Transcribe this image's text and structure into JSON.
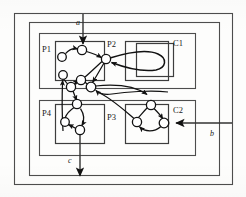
{
  "diagram": {
    "kind": "petri-net",
    "background_color": "#fdfdfc",
    "stroke_color": "#111111",
    "box_stroke_color": "#4d4d4d"
  },
  "containers": [
    {
      "id": "outer",
      "label": "",
      "x": 14,
      "y": 13,
      "w": 219,
      "h": 172
    },
    {
      "id": "system",
      "label": "",
      "x": 29,
      "y": 22,
      "w": 191,
      "h": 154
    },
    {
      "id": "C1",
      "label": "C1",
      "x": 39,
      "y": 33,
      "w": 157,
      "h": 56,
      "label_x": 173,
      "label_y": 46
    },
    {
      "id": "C2",
      "label": "C2",
      "x": 39,
      "y": 100,
      "w": 157,
      "h": 56,
      "label_x": 173,
      "label_y": 113
    }
  ],
  "processes": [
    {
      "id": "P1",
      "label": "P1",
      "x": 55,
      "y": 41,
      "w": 50,
      "h": 40,
      "label_x": 43,
      "label_y": 51
    },
    {
      "id": "P2",
      "label": "P2",
      "x": 125,
      "y": 41,
      "w": 44,
      "h": 40,
      "label_x": 108,
      "label_y": 47
    },
    {
      "id": "P4",
      "label": "P4",
      "x": 55,
      "y": 104,
      "w": 50,
      "h": 40,
      "label_x": 43,
      "label_y": 115
    },
    {
      "id": "P3",
      "label": "P3",
      "x": 125,
      "y": 104,
      "w": 44,
      "h": 40,
      "label_x": 108,
      "label_y": 118
    }
  ],
  "places": [
    {
      "id": "p1-left",
      "cx": 62,
      "cy": 57,
      "r": 4.3
    },
    {
      "id": "p1-top",
      "cx": 82,
      "cy": 50,
      "r": 4.6
    },
    {
      "id": "p1-lower",
      "cx": 63,
      "cy": 75,
      "r": 4.3
    },
    {
      "id": "p2-main",
      "cx": 106,
      "cy": 59,
      "r": 4.6
    },
    {
      "id": "mid-left",
      "cx": 71,
      "cy": 87,
      "r": 4.6
    },
    {
      "id": "mid-up",
      "cx": 81,
      "cy": 80,
      "r": 4.6
    },
    {
      "id": "mid-right",
      "cx": 91,
      "cy": 87,
      "r": 4.8
    },
    {
      "id": "p4-top",
      "cx": 77,
      "cy": 104,
      "r": 4.6
    },
    {
      "id": "p4-left",
      "cx": 65,
      "cy": 122,
      "r": 4.3
    },
    {
      "id": "p4-bot",
      "cx": 80,
      "cy": 130,
      "r": 4.6
    },
    {
      "id": "p3-top",
      "cx": 151,
      "cy": 105,
      "r": 4.6
    },
    {
      "id": "p3-left",
      "cx": 137,
      "cy": 122,
      "r": 4.6
    },
    {
      "id": "p3-right",
      "cx": 164,
      "cy": 123,
      "r": 4.8
    }
  ],
  "ports": [
    {
      "id": "a",
      "label": "a",
      "direction": "input",
      "orientation": "vertical",
      "label_x": 78,
      "label_y": 24,
      "line_from_x": 83,
      "line_from_y": 14,
      "line_to_x": 83,
      "line_to_y": 45
    },
    {
      "id": "b",
      "label": "b",
      "direction": "input",
      "orientation": "horizontal",
      "label_x": 211,
      "label_y": 134,
      "line_from_x": 232,
      "line_from_y": 123,
      "line_to_x": 172,
      "line_to_y": 123
    },
    {
      "id": "c",
      "label": "c",
      "direction": "output",
      "orientation": "vertical",
      "label_x": 69,
      "label_y": 162,
      "line_from_x": 80,
      "line_from_y": 131,
      "line_to_x": 80,
      "line_to_y": 178
    }
  ],
  "self_loop": {
    "id": "p2-self-loop",
    "label": "",
    "box": {
      "x": 136,
      "y": 43,
      "w": 38,
      "h": 34
    },
    "from_place": "p2-main"
  },
  "labels": {
    "C1": "C1",
    "C2": "C2",
    "P1": "P1",
    "P2": "P2",
    "P3": "P3",
    "P4": "P4",
    "a": "a",
    "b": "b",
    "c": "c"
  }
}
